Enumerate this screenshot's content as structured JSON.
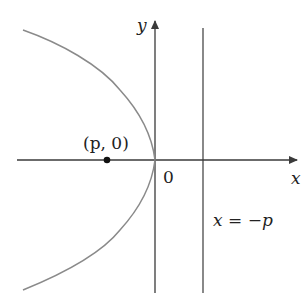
{
  "diagram": {
    "type": "parabola",
    "equation_form": "y^2 = 4px with p < 0 (opens left)",
    "colors": {
      "axes": "#3a3a3a",
      "curve": "#8a8a8a",
      "directrix": "#3a3a3a",
      "focus": "#111111",
      "text": "#222222"
    },
    "labels": {
      "y_axis": "y",
      "x_axis": "x",
      "origin": "0",
      "focus": "(p, 0)",
      "directrix": "x = −p"
    }
  }
}
